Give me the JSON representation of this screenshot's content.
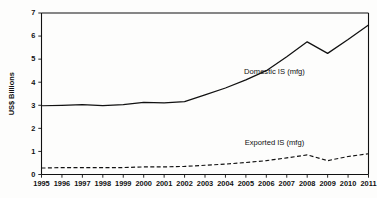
{
  "chart_data": {
    "type": "line",
    "title": "",
    "xlabel": "",
    "ylabel": "US$ Billions",
    "x": [
      1995,
      1996,
      1997,
      1998,
      1999,
      2000,
      2001,
      2002,
      2003,
      2004,
      2005,
      2006,
      2007,
      2008,
      2009,
      2010,
      2011
    ],
    "categories": [
      "1995",
      "1996",
      "1997",
      "1998",
      "1999",
      "2000",
      "2001",
      "2002",
      "2003",
      "2004",
      "2005",
      "2006",
      "2007",
      "2008",
      "2009",
      "2010",
      "2011"
    ],
    "xlim": [
      1995,
      2011
    ],
    "ylim": [
      0,
      7
    ],
    "yticks": [
      0,
      1,
      2,
      3,
      4,
      5,
      6,
      7
    ],
    "yticklabels": [
      "0",
      "1",
      "2",
      "3",
      "4",
      "5",
      "6",
      "7"
    ],
    "grid": false,
    "legend_position": "inline-annotation",
    "series": [
      {
        "name": "Domestic IS (mfg)",
        "style": "solid",
        "color": "#111111",
        "values": [
          2.98,
          3.0,
          3.03,
          2.99,
          3.03,
          3.13,
          3.1,
          3.16,
          3.45,
          3.75,
          4.1,
          4.5,
          5.1,
          5.75,
          5.25,
          5.85,
          6.48
        ]
      },
      {
        "name": "Exported IS (mfg)",
        "style": "dashed",
        "color": "#111111",
        "values": [
          0.28,
          0.3,
          0.3,
          0.3,
          0.3,
          0.33,
          0.33,
          0.35,
          0.4,
          0.45,
          0.52,
          0.6,
          0.72,
          0.85,
          0.6,
          0.78,
          0.9
        ]
      }
    ],
    "annotations": [
      {
        "text": "Domestic IS (mfg)",
        "x": 2006.4,
        "y": 4.35
      },
      {
        "text": "Exported IS (mfg)",
        "x": 2006.4,
        "y": 1.28
      }
    ]
  }
}
